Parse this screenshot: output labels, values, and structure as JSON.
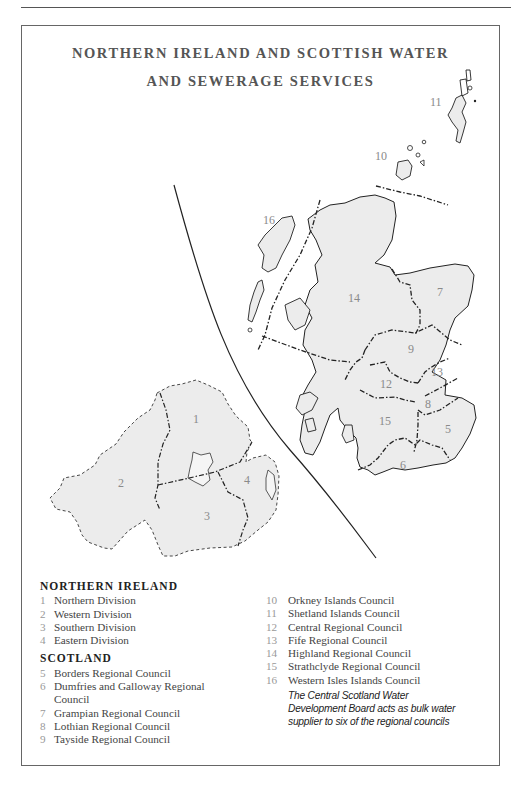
{
  "title": {
    "line1": "NORTHERN IRELAND AND SCOTTISH WATER",
    "line2": "AND SEWERAGE SERVICES"
  },
  "colors": {
    "region_fill": "#ececec",
    "outline": "#222222",
    "numeral": "#8a8a8a",
    "frame": "#666666"
  },
  "map": {
    "region_labels": [
      {
        "id": "1",
        "x": 193,
        "y": 423
      },
      {
        "id": "2",
        "x": 118,
        "y": 487
      },
      {
        "id": "3",
        "x": 204,
        "y": 520
      },
      {
        "id": "4",
        "x": 244,
        "y": 484
      },
      {
        "id": "5",
        "x": 445,
        "y": 433
      },
      {
        "id": "6",
        "x": 400,
        "y": 469
      },
      {
        "id": "7",
        "x": 437,
        "y": 296
      },
      {
        "id": "8",
        "x": 425,
        "y": 408
      },
      {
        "id": "9",
        "x": 408,
        "y": 353
      },
      {
        "id": "10",
        "x": 375,
        "y": 160
      },
      {
        "id": "11",
        "x": 430,
        "y": 106
      },
      {
        "id": "12",
        "x": 380,
        "y": 388
      },
      {
        "id": "13",
        "x": 431,
        "y": 376
      },
      {
        "id": "14",
        "x": 348,
        "y": 302
      },
      {
        "id": "15",
        "x": 379,
        "y": 425
      },
      {
        "id": "16",
        "x": 263,
        "y": 224
      }
    ]
  },
  "legend": {
    "northern_ireland": {
      "heading": "NORTHERN IRELAND",
      "items": [
        {
          "num": "1",
          "label": "Northern Division"
        },
        {
          "num": "2",
          "label": "Western Division"
        },
        {
          "num": "3",
          "label": "Southern Division"
        },
        {
          "num": "4",
          "label": "Eastern Division"
        }
      ]
    },
    "scotland": {
      "heading": "SCOTLAND",
      "items_col1": [
        {
          "num": "5",
          "label": "Borders Regional Council"
        },
        {
          "num": "6",
          "label": "Dumfries and Galloway Regional Council"
        },
        {
          "num": "7",
          "label": "Grampian Regional Council"
        },
        {
          "num": "8",
          "label": "Lothian Regional Council"
        },
        {
          "num": "9",
          "label": "Tayside Regional Council"
        }
      ],
      "items_col2": [
        {
          "num": "10",
          "label": "Orkney Islands Council"
        },
        {
          "num": "11",
          "label": "Shetland Islands Council"
        },
        {
          "num": "12",
          "label": "Central Regional Council"
        },
        {
          "num": "13",
          "label": "Fife Regional Council"
        },
        {
          "num": "14",
          "label": "Highland Regional Council"
        },
        {
          "num": "15",
          "label": "Strathclyde Regional Council"
        },
        {
          "num": "16",
          "label": "Western Isles Islands Council"
        }
      ]
    },
    "note": "The Central Scotland Water Development Board acts as bulk water supplier to six of the regional councils"
  }
}
